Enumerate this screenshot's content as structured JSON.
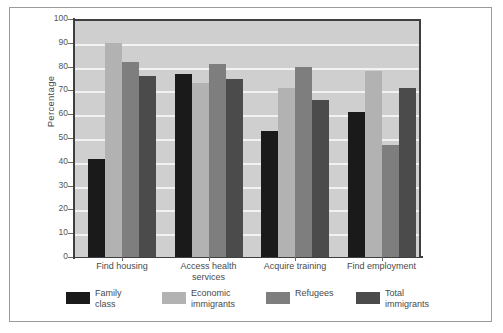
{
  "chart_data": {
    "type": "bar",
    "title": "",
    "subtitle": "",
    "xlabel": "",
    "ylabel": "Percentage",
    "ylim": [
      0,
      100
    ],
    "yticks": [
      0,
      10,
      20,
      30,
      40,
      50,
      60,
      70,
      80,
      90,
      100
    ],
    "grid": true,
    "legend_position": "bottom",
    "categories": [
      "Find housing",
      "Access health\nservices",
      "Acquire training",
      "Find employment"
    ],
    "category_labels_flat": [
      "Find housing",
      "Access health services",
      "Acquire training",
      "Find employment"
    ],
    "series": [
      {
        "name": "Family\nclass",
        "name_flat": "Family class",
        "color": "#1a1a1a",
        "values": [
          41,
          77,
          53,
          61
        ]
      },
      {
        "name": "Economic\nimmigrants",
        "name_flat": "Economic immigrants",
        "color": "#b2b2b2",
        "values": [
          90,
          73,
          71,
          78
        ]
      },
      {
        "name": "Refugees",
        "name_flat": "Refugees",
        "color": "#7e7e7e",
        "values": [
          82,
          81,
          80,
          47
        ]
      },
      {
        "name": "Total\nimmigrants",
        "name_flat": "Total immigrants",
        "color": "#4b4b4b",
        "values": [
          76,
          75,
          66,
          71
        ]
      }
    ],
    "plot_background": "#cfcfcf",
    "gridline_color": "#f2f2f2",
    "axis_color": "#3f3f3f",
    "frame_color": "#9a9a9a",
    "page_background": "#ffffff"
  }
}
